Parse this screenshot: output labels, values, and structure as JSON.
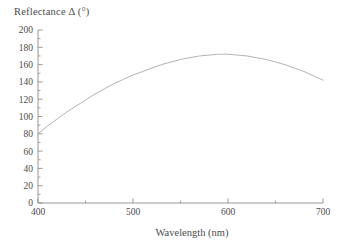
{
  "chart_data": {
    "type": "line",
    "title": "",
    "ylabel": "Reflectance Δ (°)",
    "xlabel": "Wavelength (nm)",
    "xlim": [
      400,
      700
    ],
    "ylim": [
      0,
      200
    ],
    "xticks": [
      400,
      500,
      600,
      700
    ],
    "xtick_labels": [
      "400",
      "500",
      "600",
      "700"
    ],
    "xminor_ticks": [
      450,
      550,
      650
    ],
    "yticks": [
      0,
      20,
      40,
      60,
      80,
      100,
      120,
      140,
      160,
      180,
      200
    ],
    "ytick_labels": [
      "0",
      "20",
      "40",
      "60",
      "80",
      "100",
      "120",
      "140",
      "160",
      "180",
      "200"
    ],
    "yminor_ticks": [
      10,
      30,
      50,
      70,
      90,
      110,
      130,
      150,
      170,
      190
    ],
    "grid": false,
    "legend": false,
    "series": [
      {
        "name": "Reflectance phase difference",
        "color": "#b4b4b4",
        "x": [
          400,
          410,
          420,
          430,
          440,
          450,
          460,
          470,
          480,
          490,
          500,
          510,
          520,
          530,
          540,
          550,
          560,
          570,
          580,
          590,
          600,
          610,
          620,
          630,
          640,
          650,
          660,
          670,
          680,
          690,
          700
        ],
        "y": [
          80,
          89,
          97,
          105,
          112,
          119,
          126,
          132,
          138,
          143,
          148,
          152,
          156,
          160,
          163,
          166,
          168,
          170,
          171,
          172,
          172,
          171,
          170,
          168,
          166,
          163,
          160,
          156,
          152,
          147,
          142
        ]
      }
    ]
  },
  "axis": {
    "line_color": "#8c8c8c",
    "tick_color": "#8c8c8c"
  }
}
